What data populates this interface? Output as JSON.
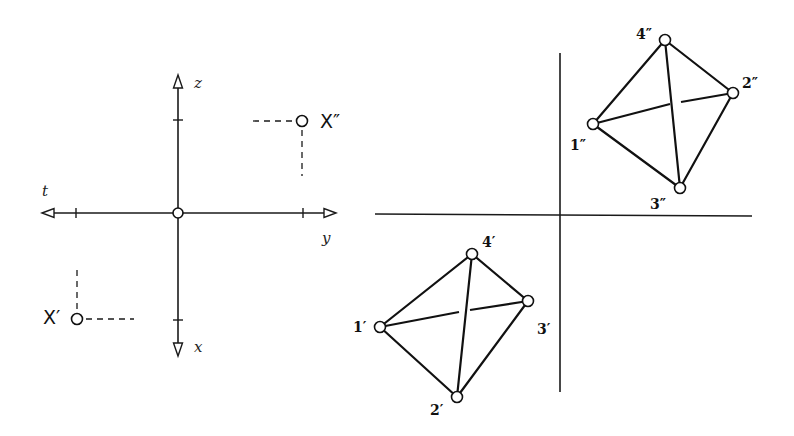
{
  "left_figure": {
    "axes": {
      "horizontal": {
        "left_label": "t",
        "right_label": "y"
      },
      "vertical": {
        "top_label": "z",
        "bottom_label": "x"
      }
    },
    "points": {
      "x_double_prime": "X″",
      "x_prime": "X′"
    }
  },
  "right_figure": {
    "front_view_vertices": [
      {
        "id": "1p",
        "label": "1′"
      },
      {
        "id": "2p",
        "label": "2′"
      },
      {
        "id": "3p",
        "label": "3′"
      },
      {
        "id": "4p",
        "label": "4′"
      }
    ],
    "top_view_vertices": [
      {
        "id": "1pp",
        "label": "1″"
      },
      {
        "id": "2pp",
        "label": "2″"
      },
      {
        "id": "3pp",
        "label": "3″"
      },
      {
        "id": "4pp",
        "label": "4″"
      }
    ]
  }
}
